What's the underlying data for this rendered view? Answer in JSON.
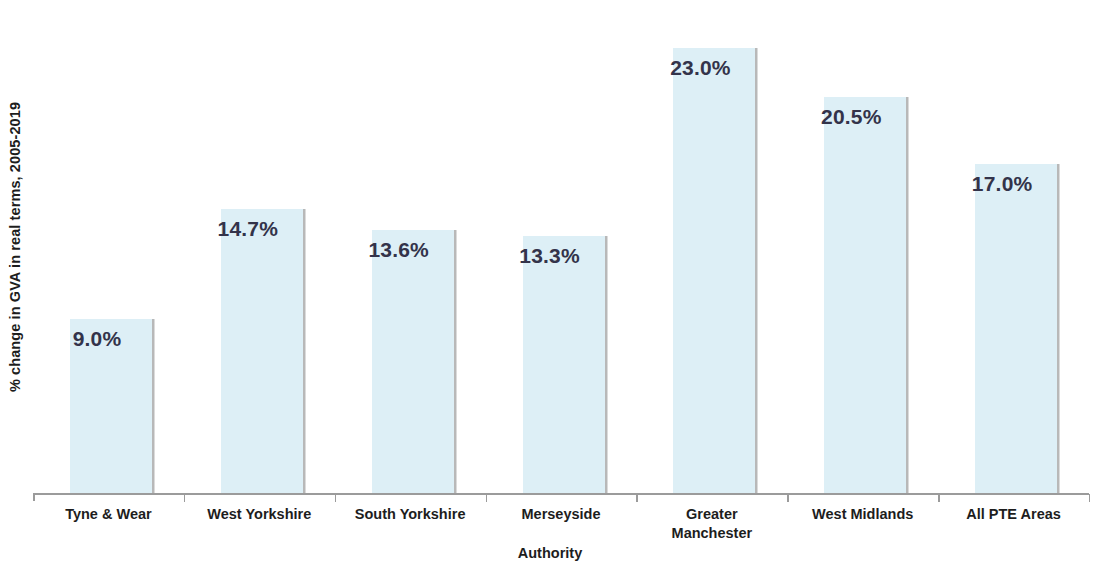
{
  "chart_data": {
    "type": "bar",
    "title": "",
    "subtitle": "",
    "xlabel": "Authority",
    "ylabel": "% change in GVA in real terms, 2005-2019",
    "categories": [
      "Tyne & Wear",
      "West Yorkshire",
      "South Yorkshire",
      "Merseyside",
      "Greater\nManchester",
      "West Midlands",
      "All PTE Areas"
    ],
    "values": [
      9.0,
      14.7,
      13.6,
      13.3,
      23.0,
      20.5,
      17.0
    ],
    "data_labels": [
      "9.0%",
      "14.7%",
      "13.6%",
      "13.3%",
      "23.0%",
      "20.5%",
      "17.0%"
    ],
    "ylim": [
      0,
      25.5
    ],
    "grid": false,
    "legend": null,
    "y_tick_labels": [],
    "bar_color": "#ddeff6",
    "bar_shadow_color": "#b8b8b8",
    "label_text_color": "#33334a",
    "axis_color": "#9b9b9b",
    "axis_text_color": "#1d1d1d"
  },
  "axis": {
    "y_title": "% change in GVA in real terms, 2005-2019",
    "x_title": "Authority"
  }
}
